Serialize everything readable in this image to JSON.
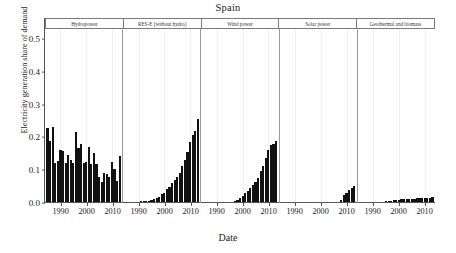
{
  "chart_data": {
    "type": "bar",
    "title": "Spain",
    "xlabel": "Date",
    "ylabel": "Electricity generation share of demand",
    "ylim": [
      0.0,
      0.53
    ],
    "yticks": [
      "0.0",
      "0.1",
      "0.2",
      "0.3",
      "0.4",
      "0.5"
    ],
    "ytick_values": [
      0.0,
      0.1,
      0.2,
      0.3,
      0.4,
      0.5
    ],
    "xticks": [
      "1990",
      "2000",
      "2010"
    ],
    "xtick_values": [
      1990,
      2000,
      2010
    ],
    "xlim": [
      1984,
      2014
    ],
    "grid": true,
    "legend": "none",
    "bar_color": "#111111",
    "facets": [
      {
        "label": "Hydropower",
        "years": [
          1985,
          1986,
          1987,
          1988,
          1989,
          1990,
          1991,
          1992,
          1993,
          1994,
          1995,
          1996,
          1997,
          1998,
          1999,
          2000,
          2001,
          2002,
          2003,
          2004,
          2005,
          2006,
          2007,
          2008,
          2009,
          2010,
          2011,
          2012,
          2013
        ],
        "values": [
          0.227,
          0.19,
          0.232,
          0.122,
          0.127,
          0.16,
          0.157,
          0.121,
          0.146,
          0.131,
          0.123,
          0.216,
          0.168,
          0.181,
          0.121,
          0.126,
          0.172,
          0.12,
          0.152,
          0.12,
          0.08,
          0.063,
          0.09,
          0.088,
          0.078,
          0.126,
          0.105,
          0.068,
          0.142
        ]
      },
      {
        "label": "RES-E (without hydro)",
        "years": [
          1985,
          1986,
          1987,
          1988,
          1989,
          1990,
          1991,
          1992,
          1993,
          1994,
          1995,
          1996,
          1997,
          1998,
          1999,
          2000,
          2001,
          2002,
          2003,
          2004,
          2005,
          2006,
          2007,
          2008,
          2009,
          2010,
          2011,
          2012,
          2013
        ],
        "values": [
          0.003,
          0.003,
          0.003,
          0.004,
          0.004,
          0.004,
          0.005,
          0.005,
          0.006,
          0.007,
          0.009,
          0.011,
          0.014,
          0.019,
          0.026,
          0.032,
          0.043,
          0.05,
          0.061,
          0.07,
          0.08,
          0.092,
          0.114,
          0.132,
          0.156,
          0.185,
          0.207,
          0.22,
          0.256
        ]
      },
      {
        "label": "Wind power",
        "years": [
          1985,
          1986,
          1987,
          1988,
          1989,
          1990,
          1991,
          1992,
          1993,
          1994,
          1995,
          1996,
          1997,
          1998,
          1999,
          2000,
          2001,
          2002,
          2003,
          2004,
          2005,
          2006,
          2007,
          2008,
          2009,
          2010,
          2011,
          2012,
          2013
        ],
        "values": [
          0.0,
          0.0,
          0.0,
          0.0,
          0.0,
          0.0,
          0.0,
          0.0,
          0.0,
          0.001,
          0.002,
          0.003,
          0.005,
          0.009,
          0.015,
          0.021,
          0.031,
          0.037,
          0.047,
          0.055,
          0.064,
          0.075,
          0.097,
          0.113,
          0.136,
          0.16,
          0.177,
          0.18,
          0.19
        ]
      },
      {
        "label": "Solar power",
        "years": [
          1985,
          1986,
          1987,
          1988,
          1989,
          1990,
          1991,
          1992,
          1993,
          1994,
          1995,
          1996,
          1997,
          1998,
          1999,
          2000,
          2001,
          2002,
          2003,
          2004,
          2005,
          2006,
          2007,
          2008,
          2009,
          2010,
          2011,
          2012,
          2013
        ],
        "values": [
          0.0,
          0.0,
          0.0,
          0.0,
          0.0,
          0.0,
          0.0,
          0.0,
          0.0,
          0.0,
          0.0,
          0.0,
          0.0,
          0.0,
          0.0,
          0.0,
          0.0,
          0.0,
          0.0,
          0.0,
          0.0,
          0.001,
          0.002,
          0.009,
          0.024,
          0.032,
          0.041,
          0.047,
          0.051
        ]
      },
      {
        "label": "Geothermal and biomass",
        "years": [
          1985,
          1986,
          1987,
          1988,
          1989,
          1990,
          1991,
          1992,
          1993,
          1994,
          1995,
          1996,
          1997,
          1998,
          1999,
          2000,
          2001,
          2002,
          2003,
          2004,
          2005,
          2006,
          2007,
          2008,
          2009,
          2010,
          2011,
          2012,
          2013
        ],
        "values": [
          0.001,
          0.001,
          0.001,
          0.001,
          0.002,
          0.002,
          0.002,
          0.003,
          0.003,
          0.004,
          0.005,
          0.006,
          0.007,
          0.008,
          0.009,
          0.01,
          0.011,
          0.011,
          0.012,
          0.012,
          0.013,
          0.013,
          0.014,
          0.014,
          0.014,
          0.014,
          0.015,
          0.016,
          0.017
        ]
      }
    ]
  }
}
